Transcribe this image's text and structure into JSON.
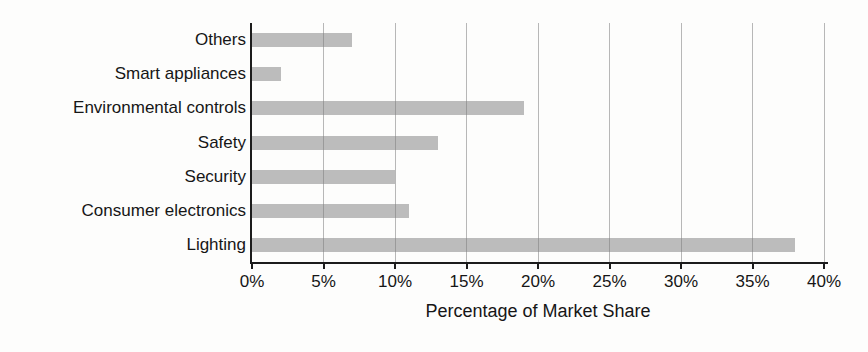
{
  "chart_data": {
    "type": "bar",
    "orientation": "horizontal",
    "title": "",
    "xlabel": "Percentage of Market Share",
    "ylabel": "",
    "categories": [
      "Others",
      "Smart appliances",
      "Environmental controls",
      "Safety",
      "Security",
      "Consumer electronics",
      "Lighting"
    ],
    "values": [
      7,
      2,
      19,
      13,
      10,
      11,
      38
    ],
    "unit": "%",
    "xlim": [
      0,
      40
    ],
    "x_tick_values": [
      0,
      5,
      10,
      15,
      20,
      25,
      30,
      35,
      40
    ],
    "x_tick_labels": [
      "0%",
      "5%",
      "10%",
      "15%",
      "20%",
      "25%",
      "30%",
      "35%",
      "40%"
    ],
    "grid": "vertical-only",
    "legend": "none",
    "colors": {
      "bar": "#bcbcbc",
      "gridline": "rgba(125,125,125,0.55)",
      "axis": "#1c1c1c",
      "text": "#161616",
      "background": "#fdfdfc"
    }
  }
}
